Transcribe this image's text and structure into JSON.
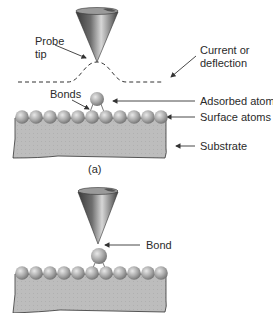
{
  "panel_a": {
    "caption": "(a)",
    "labels": {
      "probe_tip_line1": "Probe",
      "probe_tip_line2": "tip",
      "current_line1": "Current or",
      "current_line2": "deflection",
      "bonds": "Bonds",
      "adsorbed_atom": "Adsorbed atom",
      "surface_atoms": "Surface atoms",
      "substrate": "Substrate"
    },
    "surface_atom_count": 11
  },
  "panel_b": {
    "labels": {
      "bond": "Bond"
    },
    "surface_atom_count": 11
  },
  "colors": {
    "substrate": "#b9b9b9",
    "atom": "#a8a8a8",
    "probe_dark": "#4a4a4a",
    "probe_light": "#cfcfcf",
    "line": "#333333"
  }
}
